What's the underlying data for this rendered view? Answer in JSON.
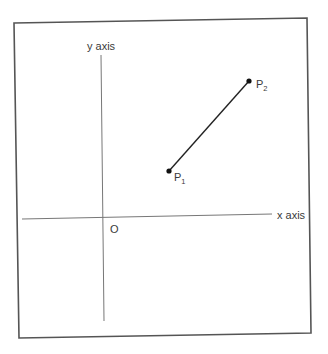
{
  "diagram": {
    "type": "coordinate-plane",
    "labels": {
      "y_axis": "y axis",
      "x_axis": "x axis",
      "origin": "O"
    },
    "points": [
      {
        "name": "P",
        "subscript": "1"
      },
      {
        "name": "P",
        "subscript": "2"
      }
    ],
    "segment": "P1-P2",
    "colors": {
      "frame": "#555555",
      "axis": "#666666",
      "segment": "#222222",
      "point": "#111111",
      "text": "#3a3a3a"
    }
  }
}
